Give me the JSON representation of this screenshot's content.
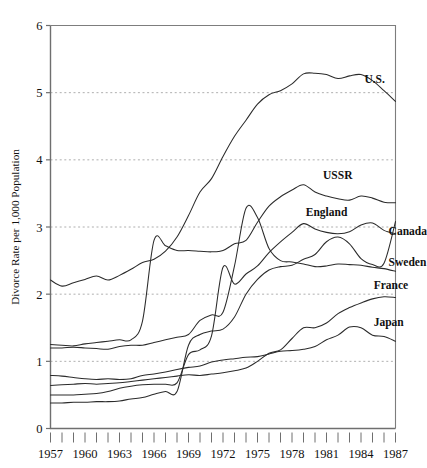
{
  "chart_data": {
    "type": "line",
    "title": "",
    "subtitle": "",
    "xlabel": "",
    "ylabel": "Divorce Rate per 1,000 Population",
    "xlim": [
      1957,
      1987
    ],
    "ylim": [
      0,
      6
    ],
    "grid": "horizontal dashed gridlines at y = 1, 2, 3, 4, 5",
    "legend_position": "inline labels at right end of each line",
    "y_ticks": [
      0,
      1,
      2,
      3,
      4,
      5,
      6
    ],
    "y_tick_labels": [
      "0",
      "1",
      "2",
      "3",
      "4",
      "5",
      "6"
    ],
    "x_ticks": [
      1957,
      1958,
      1959,
      1960,
      1961,
      1962,
      1963,
      1964,
      1965,
      1966,
      1967,
      1968,
      1969,
      1970,
      1971,
      1972,
      1973,
      1974,
      1975,
      1976,
      1977,
      1978,
      1979,
      1980,
      1981,
      1982,
      1983,
      1984,
      1985,
      1986,
      1987
    ],
    "x_tick_labels": [
      "1957",
      "1960",
      "1963",
      "1966",
      "1969",
      "1972",
      "1975",
      "1978",
      "1981",
      "1984",
      "1987"
    ],
    "x_labeled_years": [
      1957,
      1960,
      1963,
      1966,
      1969,
      1972,
      1975,
      1978,
      1981,
      1984,
      1987
    ],
    "years": [
      1957,
      1958,
      1959,
      1960,
      1961,
      1962,
      1963,
      1964,
      1965,
      1966,
      1967,
      1968,
      1969,
      1970,
      1971,
      1972,
      1973,
      1974,
      1975,
      1976,
      1977,
      1978,
      1979,
      1980,
      1981,
      1982,
      1983,
      1984,
      1985,
      1986,
      1987
    ],
    "series": [
      {
        "name": "U.S.",
        "label": "U.S.",
        "label_year": 1984.3,
        "label_value": 5.15,
        "values": [
          2.21,
          2.12,
          2.17,
          2.22,
          2.27,
          2.21,
          2.28,
          2.37,
          2.47,
          2.52,
          2.64,
          2.85,
          3.17,
          3.52,
          3.72,
          4.05,
          4.35,
          4.59,
          4.83,
          4.97,
          5.03,
          5.13,
          5.28,
          5.29,
          5.27,
          5.21,
          5.25,
          5.27,
          5.18,
          5.03,
          4.87
        ],
        "peak": {
          "year": 1981,
          "value": 5.3
        }
      },
      {
        "name": "USSR",
        "label": "USSR",
        "label_year": 1980.7,
        "label_value": 3.72,
        "values": [
          1.25,
          1.24,
          1.23,
          1.26,
          1.28,
          1.3,
          1.32,
          1.32,
          1.6,
          2.8,
          2.72,
          2.65,
          2.65,
          2.64,
          2.63,
          2.65,
          2.75,
          2.8,
          3.07,
          3.31,
          3.45,
          3.55,
          3.63,
          3.52,
          3.46,
          3.42,
          3.4,
          3.46,
          3.43,
          3.37,
          3.36
        ],
        "peak": {
          "year": 1979,
          "value": 3.64
        }
      },
      {
        "name": "England",
        "label": "England",
        "label_year": 1979.2,
        "label_value": 3.16,
        "values": [
          0.5,
          0.5,
          0.5,
          0.51,
          0.52,
          0.55,
          0.6,
          0.63,
          0.65,
          0.66,
          0.66,
          0.68,
          1.1,
          1.17,
          1.38,
          2.4,
          2.15,
          2.3,
          2.42,
          2.62,
          2.78,
          2.92,
          3.05,
          2.97,
          2.92,
          2.9,
          2.93,
          3.03,
          3.06,
          2.95,
          2.9
        ],
        "note": "sharp rise after the 1969 Divorce Reform Act; spike near 1972"
      },
      {
        "name": "Canada",
        "label": "Canada",
        "label_year": 1986.4,
        "label_value": 2.88,
        "values": [
          0.38,
          0.38,
          0.39,
          0.39,
          0.4,
          0.4,
          0.41,
          0.44,
          0.46,
          0.51,
          0.55,
          0.55,
          1.24,
          1.4,
          1.45,
          1.48,
          1.66,
          2.0,
          2.22,
          2.36,
          2.41,
          2.43,
          2.52,
          2.59,
          2.78,
          2.85,
          2.75,
          2.53,
          2.44,
          2.46,
          3.08
        ],
        "note": "steep rise after 1968 Divorce Act; sharp jump in 1987"
      },
      {
        "name": "Sweden",
        "label": "Sweden",
        "label_year": 1986.4,
        "label_value": 2.42,
        "values": [
          1.2,
          1.2,
          1.21,
          1.2,
          1.19,
          1.18,
          1.22,
          1.24,
          1.24,
          1.28,
          1.32,
          1.36,
          1.4,
          1.61,
          1.69,
          1.73,
          2.42,
          3.28,
          3.14,
          2.68,
          2.5,
          2.48,
          2.45,
          2.41,
          2.42,
          2.45,
          2.44,
          2.43,
          2.4,
          2.38,
          2.34
        ],
        "note": "large spike at 1974 new marriage law"
      },
      {
        "name": "France",
        "label": "France",
        "label_year": 1985.1,
        "label_value": 2.08,
        "values": [
          0.64,
          0.65,
          0.66,
          0.67,
          0.66,
          0.67,
          0.68,
          0.7,
          0.72,
          0.74,
          0.76,
          0.78,
          0.8,
          0.79,
          0.81,
          0.83,
          0.86,
          0.9,
          1.0,
          1.12,
          1.17,
          1.34,
          1.5,
          1.5,
          1.57,
          1.71,
          1.8,
          1.87,
          1.93,
          1.96,
          1.95
        ],
        "peak": {
          "year": 1986,
          "value": 1.97
        }
      },
      {
        "name": "Japan",
        "label": "Japan",
        "label_year": 1985.1,
        "label_value": 1.52,
        "values": [
          0.79,
          0.78,
          0.76,
          0.74,
          0.73,
          0.74,
          0.73,
          0.74,
          0.79,
          0.81,
          0.84,
          0.88,
          0.91,
          0.93,
          0.99,
          1.02,
          1.04,
          1.06,
          1.07,
          1.11,
          1.15,
          1.16,
          1.18,
          1.22,
          1.32,
          1.39,
          1.51,
          1.5,
          1.39,
          1.37,
          1.3
        ],
        "peak": {
          "year": 1983,
          "value": 1.51
        }
      }
    ]
  },
  "colors": {
    "line": "#2b2b2b",
    "grid": "#9a9a9a",
    "axis": "#6f6f6f",
    "frame": "#7d7d7d",
    "text": "#111111",
    "background": "#ffffff"
  }
}
